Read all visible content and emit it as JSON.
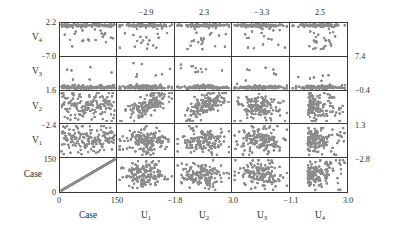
{
  "figure": {
    "type": "scatterplot-matrix",
    "variables_rows": [
      "V4",
      "V3",
      "V2",
      "V1",
      "Case"
    ],
    "variables_cols": [
      "Case",
      "U1",
      "U2",
      "U3",
      "U4"
    ],
    "point_color": "#8c8c8c",
    "axis_color": "#3a3a3a",
    "background": "#ffffff"
  },
  "row_labels": [
    {
      "text": "V",
      "sub": "4"
    },
    {
      "text": "V",
      "sub": "3"
    },
    {
      "text": "V",
      "sub": "2"
    },
    {
      "text": "V",
      "sub": "1"
    },
    {
      "text": "Case",
      "sub": ""
    }
  ],
  "col_labels": [
    {
      "text": "Case",
      "sub": ""
    },
    {
      "text": "U",
      "sub": "1"
    },
    {
      "text": "U",
      "sub": "2"
    },
    {
      "text": "U",
      "sub": "3"
    },
    {
      "text": "U",
      "sub": "4"
    }
  ],
  "ticks": {
    "left": [
      "2.2",
      "−7.0",
      "1.6",
      "−2.4",
      "150",
      "0"
    ],
    "right": [
      "7.4",
      "−0.4",
      "1.3",
      "−2.8"
    ],
    "top": [
      "−2.9",
      "2.3",
      "−3.3",
      "2.5"
    ],
    "bottom": [
      "0",
      "150",
      "−1.8",
      "3.0",
      "−1.1",
      "3.0"
    ]
  },
  "chart_data": {
    "type": "scatter",
    "title": "",
    "xlabel": "",
    "ylabel": "",
    "grid": false,
    "legend": null,
    "layout": "5x5 scatterplot matrix (lower-left style, rows V4,V3,V2,V1,Case top-to-bottom; columns Case,U1,U2,U3,U4 left-to-right)",
    "n_points": 150,
    "rows": [
      {
        "name": "V4",
        "ylim": [
          -7.0,
          2.2
        ],
        "ytick_labels": [
          "2.2",
          "−7.0"
        ]
      },
      {
        "name": "V3",
        "ylim": [
          1.6,
          7.4
        ],
        "ytick_labels": [
          "7.4",
          "1.6"
        ]
      },
      {
        "name": "V2",
        "ylim": [
          -2.4,
          -0.4
        ],
        "ytick_labels": [
          "−0.4",
          "−2.4"
        ]
      },
      {
        "name": "V1",
        "ylim": [
          -2.8,
          1.3
        ],
        "ytick_labels": [
          "1.3",
          "−2.8"
        ]
      },
      {
        "name": "Case",
        "ylim": [
          0,
          150
        ],
        "ytick_labels": [
          "150",
          "0"
        ]
      }
    ],
    "columns": [
      {
        "name": "Case",
        "xlim": [
          0,
          150
        ],
        "xtick_labels": [
          "0",
          "150"
        ]
      },
      {
        "name": "U1",
        "xlim": [
          -2.9,
          -1.8
        ],
        "xtick_labels": [
          "−1.8"
        ],
        "top_tick": "−2.9"
      },
      {
        "name": "U2",
        "xlim": [
          2.3,
          3.0
        ],
        "xtick_labels": [
          "3.0"
        ],
        "top_tick": "2.3"
      },
      {
        "name": "U3",
        "xlim": [
          -3.3,
          -1.1
        ],
        "xtick_labels": [
          "−1.1"
        ],
        "top_tick": "−3.3"
      },
      {
        "name": "U4",
        "xlim": [
          2.5,
          3.0
        ],
        "xtick_labels": [
          "3.0"
        ],
        "top_tick": "2.5"
      }
    ],
    "panel_patterns": [
      {
        "row": "V4",
        "col": "Case",
        "pattern": "dense-top-band-with-low-outliers"
      },
      {
        "row": "V4",
        "col": "U1",
        "pattern": "dense-top-band-with-low-outliers"
      },
      {
        "row": "V4",
        "col": "U2",
        "pattern": "dense-top-band-with-low-outliers"
      },
      {
        "row": "V4",
        "col": "U3",
        "pattern": "dense-top-band-with-low-outliers"
      },
      {
        "row": "V4",
        "col": "U4",
        "pattern": "dense-top-band-with-low-outliers"
      },
      {
        "row": "V3",
        "col": "Case",
        "pattern": "dense-bottom-band-with-high-outliers"
      },
      {
        "row": "V3",
        "col": "U1",
        "pattern": "dense-bottom-band-with-high-outliers"
      },
      {
        "row": "V3",
        "col": "U2",
        "pattern": "dense-bottom-band-with-high-outliers"
      },
      {
        "row": "V3",
        "col": "U3",
        "pattern": "dense-bottom-band-with-high-outliers"
      },
      {
        "row": "V3",
        "col": "U4",
        "pattern": "dense-bottom-band-with-high-outliers"
      },
      {
        "row": "V2",
        "col": "Case",
        "pattern": "diffuse-cloud"
      },
      {
        "row": "V2",
        "col": "U1",
        "pattern": "upward-cluster"
      },
      {
        "row": "V2",
        "col": "U2",
        "pattern": "upward-cluster"
      },
      {
        "row": "V2",
        "col": "U3",
        "pattern": "blob-cluster"
      },
      {
        "row": "V2",
        "col": "U4",
        "pattern": "blob-cluster-right-skew"
      },
      {
        "row": "V1",
        "col": "Case",
        "pattern": "diffuse-cloud"
      },
      {
        "row": "V1",
        "col": "U1",
        "pattern": "blob-cluster"
      },
      {
        "row": "V1",
        "col": "U2",
        "pattern": "blob-cluster"
      },
      {
        "row": "V1",
        "col": "U3",
        "pattern": "blob-cluster"
      },
      {
        "row": "V1",
        "col": "U4",
        "pattern": "blob-cluster-right-skew"
      },
      {
        "row": "Case",
        "col": "Case",
        "pattern": "perfect-diagonal-identity-line"
      },
      {
        "row": "Case",
        "col": "U1",
        "pattern": "blob-cluster"
      },
      {
        "row": "Case",
        "col": "U2",
        "pattern": "blob-cluster"
      },
      {
        "row": "Case",
        "col": "U3",
        "pattern": "blob-cluster"
      },
      {
        "row": "Case",
        "col": "U4",
        "pattern": "blob-cluster-right-skew"
      }
    ]
  }
}
